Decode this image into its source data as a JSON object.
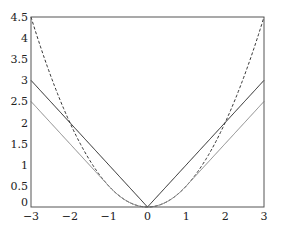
{
  "chart_data": {
    "type": "line",
    "title": "",
    "xlabel": "",
    "ylabel": "",
    "xlim": [
      -3,
      3
    ],
    "ylim": [
      0,
      4.5
    ],
    "grid": false,
    "x_ticks": [
      "−3",
      "−2",
      "−1",
      "0",
      "1",
      "2",
      "3"
    ],
    "x_tick_values": [
      -3,
      -2,
      -1,
      0,
      1,
      2,
      3
    ],
    "y_ticks": [
      "0",
      "0.5",
      "1",
      "1.5",
      "2",
      "2.5",
      "3",
      "3.5",
      "4",
      "4.5"
    ],
    "y_tick_values": [
      0,
      0.5,
      1,
      1.5,
      2,
      2.5,
      3,
      3.5,
      4,
      4.5
    ],
    "series": [
      {
        "name": "squared loss x²/2",
        "style": "dashed",
        "color": "#333333",
        "x": [
          -3,
          -2,
          -1,
          0,
          1,
          2,
          3
        ],
        "values": [
          4.5,
          2,
          0.5,
          0,
          0.5,
          2,
          4.5
        ]
      },
      {
        "name": "absolute loss |x|",
        "style": "solid",
        "color": "#222222",
        "x": [
          -3,
          -2,
          -1,
          0,
          1,
          2,
          3
        ],
        "values": [
          3,
          2,
          1,
          0,
          1,
          2,
          3
        ]
      },
      {
        "name": "Huber loss (δ=1)",
        "style": "solid",
        "color": "#888888",
        "x": [
          -3,
          -2,
          -1,
          0,
          1,
          2,
          3
        ],
        "values": [
          2.5,
          1.5,
          0.5,
          0,
          0.5,
          1.5,
          2.5
        ]
      }
    ]
  }
}
